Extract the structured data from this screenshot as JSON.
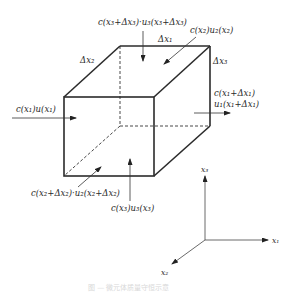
{
  "figure": {
    "type": "control-volume-cube",
    "flux_labels": {
      "top": "c(x₃+Δx₃)·u₃(x₃+Δx₃)",
      "back": "c(x₂)u₂(x₂)",
      "left": "c(x₁)u(x₁)",
      "right_line1": "c(x₁+Δx₁)",
      "right_line2": "u₁(x₁+Δx₁)",
      "front": "c(x₂+Δx₂)·u₂(x₂+Δx₂)",
      "bottom": "c(x₃)u₃(x₃)"
    },
    "edge_labels": {
      "top_edge": "Δx₁",
      "depth_edge": "Δx₂",
      "height_edge": "Δx₃"
    },
    "axes": {
      "x1": "x₁",
      "x2": "x₂",
      "x3": "x₃"
    },
    "caption": "图 — 微元体质量守恒示意"
  }
}
